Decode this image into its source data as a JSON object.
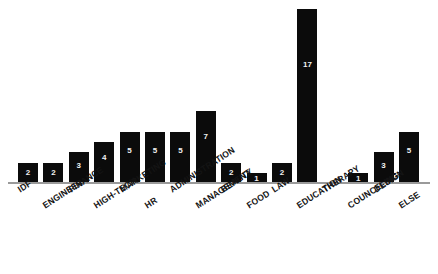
{
  "chart_data": {
    "type": "bar",
    "title": "",
    "subtitle": "",
    "xlabel": "",
    "ylabel": "",
    "grid": false,
    "legend": false,
    "axis": {
      "x_axis_visible": true,
      "y_axis_visible": false,
      "y_ticks_visible": false
    },
    "ylim": [
      0,
      17
    ],
    "value_labels_shown": true,
    "value_label_position": "inside-top",
    "bar_color": "#0b0b0b",
    "value_label_color": "#f2f2f2",
    "axis_color": "#9a9a9a",
    "background_color": "#ffffff",
    "categories": [
      "IDF",
      "ENGINEER",
      "FINANCE",
      "HIGH-TECH",
      "MARKETING",
      "HR",
      "ADMINISTRATION",
      "MANAGEMENT",
      "BEAUTY",
      "FOOD",
      "LAW",
      "EDUCATION",
      "THERAPY",
      "COUNCELING",
      "DESIGN",
      "ELSE"
    ],
    "values": [
      2,
      2,
      3,
      4,
      5,
      5,
      5,
      7,
      2,
      1,
      2,
      17,
      0,
      1,
      3,
      5
    ],
    "value_label_text": [
      "2",
      "2",
      "3",
      "4",
      "5",
      "5",
      "5",
      "7",
      "2",
      "1",
      "2",
      "17",
      "",
      "1",
      "3",
      "5"
    ]
  }
}
